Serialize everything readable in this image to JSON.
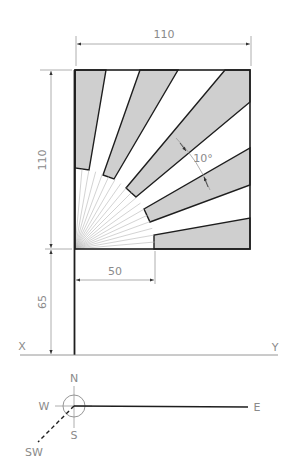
{
  "drawing": {
    "type": "orthographic projection - flagpole with sunburst flag",
    "dimensions": {
      "flag_width": "110",
      "flag_height": "110",
      "pole_below_flag": "65",
      "inner_radius": "50",
      "band_angle": "10°"
    },
    "reference_line": {
      "left_label": "X",
      "right_label": "Y"
    },
    "compass": {
      "north": "N",
      "south": "S",
      "west": "W",
      "east": "E",
      "southwest": "SW"
    },
    "bands": {
      "count": 9,
      "band_width_deg": 10,
      "shaded_ranges_deg": [
        [
          0,
          10
        ],
        [
          20,
          30
        ],
        [
          40,
          50
        ],
        [
          60,
          70
        ],
        [
          80,
          90
        ]
      ]
    },
    "colors": {
      "shade": "#cfcfcf",
      "outline": "#1e1e1e",
      "dimension": "#9a9a9a"
    }
  }
}
